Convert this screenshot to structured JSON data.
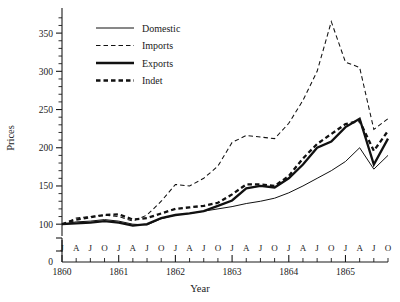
{
  "chart_data": {
    "type": "line",
    "title": "",
    "xlabel": "Year",
    "ylabel": "Prices",
    "ylim": [
      95,
      375
    ],
    "yticks": [
      100,
      150,
      200,
      250,
      300,
      350
    ],
    "yminor_step": 10,
    "axis_break_label": "0",
    "grid": false,
    "legend_position": "top-left",
    "xlim": [
      "1860-01",
      "1865-10"
    ],
    "x_major_ticks": [
      "1860",
      "1861",
      "1862",
      "1863",
      "1864",
      "1865"
    ],
    "x_minor_labels": [
      "J",
      "A",
      "J",
      "O",
      "J",
      "A",
      "J",
      "O",
      "J",
      "A",
      "J",
      "O",
      "J",
      "A",
      "J",
      "O",
      "J",
      "A",
      "J",
      "O",
      "J",
      "A",
      "J",
      "O"
    ],
    "x": [
      "1860-01",
      "1860-04",
      "1860-07",
      "1860-10",
      "1861-01",
      "1861-04",
      "1861-07",
      "1861-10",
      "1862-01",
      "1862-04",
      "1862-07",
      "1862-10",
      "1863-01",
      "1863-04",
      "1863-07",
      "1863-10",
      "1864-01",
      "1864-04",
      "1864-07",
      "1864-10",
      "1865-01",
      "1865-04",
      "1865-07",
      "1865-10"
    ],
    "series": [
      {
        "name": "Domestic",
        "style": "thin-solid",
        "values": [
          100,
          103,
          104,
          106,
          104,
          100,
          99,
          107,
          112,
          114,
          117,
          120,
          123,
          127,
          130,
          134,
          141,
          150,
          160,
          170,
          182,
          200,
          172,
          190
        ]
      },
      {
        "name": "Imports",
        "style": "thin-dashed",
        "values": [
          100,
          108,
          110,
          112,
          110,
          104,
          112,
          130,
          152,
          150,
          160,
          176,
          207,
          216,
          214,
          212,
          232,
          262,
          300,
          365,
          312,
          305,
          224,
          238
        ]
      },
      {
        "name": "Exports",
        "style": "thick-solid",
        "values": [
          100,
          101,
          102,
          104,
          102,
          98,
          100,
          108,
          112,
          114,
          117,
          124,
          131,
          147,
          150,
          148,
          160,
          178,
          200,
          208,
          227,
          238,
          178,
          212
        ]
      },
      {
        "name": "Indet",
        "style": "thick-dashed",
        "values": [
          100,
          106,
          109,
          112,
          113,
          106,
          108,
          114,
          120,
          122,
          124,
          128,
          139,
          152,
          152,
          150,
          163,
          186,
          205,
          218,
          231,
          235,
          196,
          222
        ]
      }
    ]
  },
  "legend": {
    "items": [
      {
        "label": "Domestic"
      },
      {
        "label": "Imports"
      },
      {
        "label": "Exports"
      },
      {
        "label": "Indet"
      }
    ]
  },
  "axes": {
    "y_title": "Prices",
    "x_title": "Year",
    "zero_label": "0",
    "y_tick_labels": [
      "350",
      "300",
      "250",
      "200",
      "150",
      "100"
    ],
    "x_year_labels": [
      "1860",
      "1861",
      "1862",
      "1863",
      "1864",
      "1865"
    ]
  }
}
